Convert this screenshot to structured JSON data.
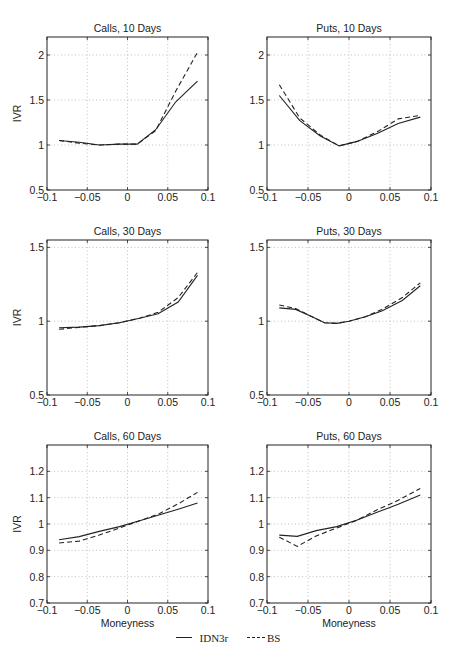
{
  "figure": {
    "legend": [
      {
        "label": "IDN3r",
        "style": "solid"
      },
      {
        "label": "BS",
        "style": "dashed"
      }
    ]
  },
  "chart_data": [
    {
      "type": "line",
      "title": "Calls, 10 Days",
      "xlabel": "",
      "ylabel": "IVR",
      "xlim": [
        -0.1,
        0.1
      ],
      "ylim": [
        0.5,
        2.2
      ],
      "xticks": [
        "-0.1",
        "-0.05",
        "0",
        "0.05",
        "0.1"
      ],
      "xtick_values": [
        -0.1,
        -0.05,
        0,
        0.05,
        0.1
      ],
      "yticks": [
        "0.5",
        "1",
        "1.5",
        "2"
      ],
      "ytick_values": [
        0.5,
        1,
        1.5,
        2
      ],
      "grid": true,
      "series": [
        {
          "name": "IDN3r",
          "style": "solid",
          "x": [
            -0.085,
            -0.06,
            -0.035,
            -0.01,
            0.012,
            0.035,
            0.06,
            0.087
          ],
          "y": [
            1.05,
            1.03,
            1.0,
            1.01,
            1.01,
            1.17,
            1.48,
            1.71
          ]
        },
        {
          "name": "BS",
          "style": "dashed",
          "x": [
            -0.085,
            -0.06,
            -0.035,
            -0.01,
            0.012,
            0.035,
            0.06,
            0.087
          ],
          "y": [
            1.05,
            1.02,
            1.0,
            1.01,
            1.01,
            1.16,
            1.6,
            2.03
          ]
        }
      ]
    },
    {
      "type": "line",
      "title": "Puts, 10 Days",
      "xlabel": "",
      "ylabel": "",
      "xlim": [
        -0.1,
        0.1
      ],
      "ylim": [
        0.5,
        2.2
      ],
      "xticks": [
        "-0.1",
        "-0.05",
        "0",
        "0.05",
        "0.1"
      ],
      "xtick_values": [
        -0.1,
        -0.05,
        0,
        0.05,
        0.1
      ],
      "yticks": [
        "0.5",
        "1",
        "1.5",
        "2"
      ],
      "ytick_values": [
        0.5,
        1,
        1.5,
        2
      ],
      "grid": true,
      "series": [
        {
          "name": "IDN3r",
          "style": "solid",
          "x": [
            -0.085,
            -0.06,
            -0.035,
            -0.012,
            0.01,
            0.035,
            0.06,
            0.087
          ],
          "y": [
            1.55,
            1.27,
            1.1,
            0.99,
            1.04,
            1.13,
            1.24,
            1.31
          ]
        },
        {
          "name": "BS",
          "style": "dashed",
          "x": [
            -0.085,
            -0.06,
            -0.035,
            -0.012,
            0.01,
            0.035,
            0.06,
            0.087
          ],
          "y": [
            1.67,
            1.3,
            1.11,
            0.99,
            1.04,
            1.15,
            1.29,
            1.33
          ]
        }
      ]
    },
    {
      "type": "line",
      "title": "Calls, 30 Days",
      "xlabel": "",
      "ylabel": "IVR",
      "xlim": [
        -0.1,
        0.1
      ],
      "ylim": [
        0.5,
        1.55
      ],
      "xticks": [
        "-0.1",
        "-0.05",
        "0",
        "0.05",
        "0.1"
      ],
      "xtick_values": [
        -0.1,
        -0.05,
        0,
        0.05,
        0.1
      ],
      "yticks": [
        "0.5",
        "1",
        "1.5"
      ],
      "ytick_values": [
        0.5,
        1,
        1.5
      ],
      "grid": true,
      "series": [
        {
          "name": "IDN3r",
          "style": "solid",
          "x": [
            -0.085,
            -0.06,
            -0.035,
            -0.01,
            0.015,
            0.038,
            0.063,
            0.087
          ],
          "y": [
            0.955,
            0.96,
            0.97,
            0.99,
            1.02,
            1.05,
            1.13,
            1.31
          ]
        },
        {
          "name": "BS",
          "style": "dashed",
          "x": [
            -0.085,
            -0.06,
            -0.035,
            -0.01,
            0.015,
            0.038,
            0.063,
            0.087
          ],
          "y": [
            0.945,
            0.958,
            0.97,
            0.99,
            1.02,
            1.06,
            1.16,
            1.33
          ]
        }
      ]
    },
    {
      "type": "line",
      "title": "Puts, 30 Days",
      "xlabel": "",
      "ylabel": "",
      "xlim": [
        -0.1,
        0.1
      ],
      "ylim": [
        0.5,
        1.55
      ],
      "xticks": [
        "-0.1",
        "-0.05",
        "0",
        "0.05",
        "0.1"
      ],
      "xtick_values": [
        -0.1,
        -0.05,
        0,
        0.05,
        0.1
      ],
      "yticks": [
        "0.5",
        "1",
        "1.5"
      ],
      "ytick_values": [
        0.5,
        1,
        1.5
      ],
      "grid": true,
      "series": [
        {
          "name": "IDN3r",
          "style": "solid",
          "x": [
            -0.085,
            -0.065,
            -0.045,
            -0.03,
            -0.015,
            0.0,
            0.02,
            0.04,
            0.065,
            0.087
          ],
          "y": [
            1.09,
            1.08,
            1.03,
            0.99,
            0.985,
            1.0,
            1.03,
            1.07,
            1.14,
            1.24
          ]
        },
        {
          "name": "BS",
          "style": "dashed",
          "x": [
            -0.085,
            -0.065,
            -0.045,
            -0.03,
            -0.015,
            0.0,
            0.02,
            0.04,
            0.065,
            0.087
          ],
          "y": [
            1.11,
            1.085,
            1.03,
            0.99,
            0.985,
            1.0,
            1.03,
            1.08,
            1.16,
            1.26
          ]
        }
      ]
    },
    {
      "type": "line",
      "title": "Calls, 60 Days",
      "xlabel": "Moneyness",
      "ylabel": "IVR",
      "xlim": [
        -0.1,
        0.1
      ],
      "ylim": [
        0.7,
        1.3
      ],
      "xticks": [
        "-0.1",
        "-0.05",
        "0",
        "0.05",
        "0.1"
      ],
      "xtick_values": [
        -0.1,
        -0.05,
        0,
        0.05,
        0.1
      ],
      "yticks": [
        "0.7",
        "0.8",
        "0.9",
        "1",
        "1.1",
        "1.2"
      ],
      "ytick_values": [
        0.7,
        0.8,
        0.9,
        1,
        1.1,
        1.2
      ],
      "grid": true,
      "series": [
        {
          "name": "IDN3r",
          "style": "solid",
          "x": [
            -0.085,
            -0.06,
            -0.035,
            -0.01,
            0.015,
            0.04,
            0.065,
            0.087
          ],
          "y": [
            0.94,
            0.952,
            0.972,
            0.99,
            1.012,
            1.035,
            1.058,
            1.08
          ]
        },
        {
          "name": "BS",
          "style": "dashed",
          "x": [
            -0.085,
            -0.06,
            -0.035,
            -0.01,
            0.015,
            0.04,
            0.065,
            0.087
          ],
          "y": [
            0.928,
            0.935,
            0.958,
            0.985,
            1.012,
            1.04,
            1.08,
            1.12
          ]
        }
      ]
    },
    {
      "type": "line",
      "title": "Puts, 60 Days",
      "xlabel": "Moneyness",
      "ylabel": "",
      "xlim": [
        -0.1,
        0.1
      ],
      "ylim": [
        0.7,
        1.3
      ],
      "xticks": [
        "-0.1",
        "-0.05",
        "0",
        "0.05",
        "0.1"
      ],
      "xtick_values": [
        -0.1,
        -0.05,
        0,
        0.05,
        0.1
      ],
      "yticks": [
        "0.7",
        "0.8",
        "0.9",
        "1",
        "1.1",
        "1.2"
      ],
      "ytick_values": [
        0.7,
        0.8,
        0.9,
        1,
        1.1,
        1.2
      ],
      "grid": true,
      "series": [
        {
          "name": "IDN3r",
          "style": "solid",
          "x": [
            -0.085,
            -0.063,
            -0.04,
            -0.015,
            0.01,
            0.035,
            0.06,
            0.087
          ],
          "y": [
            0.958,
            0.953,
            0.975,
            0.99,
            1.015,
            1.045,
            1.075,
            1.11
          ]
        },
        {
          "name": "BS",
          "style": "dashed",
          "x": [
            -0.085,
            -0.063,
            -0.04,
            -0.015,
            0.01,
            0.035,
            0.06,
            0.087
          ],
          "y": [
            0.95,
            0.915,
            0.955,
            0.985,
            1.015,
            1.055,
            1.09,
            1.135
          ]
        }
      ]
    }
  ]
}
